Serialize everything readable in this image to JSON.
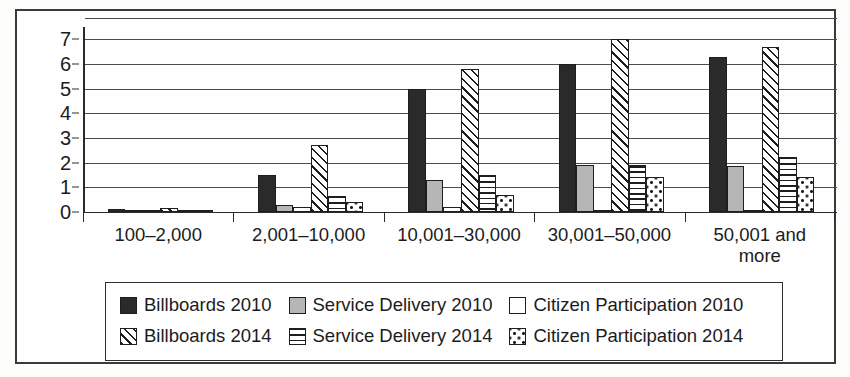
{
  "chart_data": {
    "type": "bar",
    "title": "",
    "subtitle": "",
    "xlabel": "",
    "ylabel": "",
    "ylim": [
      0,
      7.5
    ],
    "yticks": [
      0,
      1,
      2,
      3,
      4,
      5,
      6,
      7
    ],
    "ytick_labels": [
      "0",
      "1",
      "2",
      "3",
      "4",
      "5",
      "6",
      "7"
    ],
    "grid": "horizontal",
    "legend_position": "bottom",
    "categories": [
      "100–2,000",
      "2,001–10,000",
      "10,001–30,000",
      "30,001–50,000",
      "50,001 and\nmore"
    ],
    "series": [
      {
        "name": "Billboards 2010",
        "pattern": "solid-black",
        "values": [
          0.12,
          1.5,
          5.0,
          6.0,
          6.3
        ]
      },
      {
        "name": "Service Delivery 2010",
        "pattern": "solid-gray",
        "values": [
          0.0,
          0.3,
          1.3,
          1.9,
          1.85
        ]
      },
      {
        "name": "Citizen Participation 2010",
        "pattern": "solid-white",
        "values": [
          0.0,
          0.2,
          0.2,
          0.1,
          0.1
        ]
      },
      {
        "name": "Billboards 2014",
        "pattern": "diagonal-hatch",
        "values": [
          0.18,
          2.7,
          5.8,
          7.0,
          6.7
        ]
      },
      {
        "name": "Service Delivery 2014",
        "pattern": "horizontal-lines",
        "values": [
          0.08,
          0.65,
          1.5,
          1.9,
          2.25
        ]
      },
      {
        "name": "Citizen Participation 2014",
        "pattern": "dotted",
        "values": [
          0.05,
          0.4,
          0.7,
          1.4,
          1.4
        ]
      }
    ]
  },
  "legend": {
    "rows": [
      [
        {
          "label": "Billboards 2010",
          "swatch": "solid-black-swatch"
        },
        {
          "label": "Service Delivery 2010",
          "swatch": "solid-gray-swatch"
        },
        {
          "label": "Citizen Participation 2010",
          "swatch": "solid-white-swatch"
        }
      ],
      [
        {
          "label": "Billboards 2014",
          "swatch": "diagonal-hatch-swatch"
        },
        {
          "label": "Service Delivery 2014",
          "swatch": "horizontal-lines-swatch"
        },
        {
          "label": "Citizen Participation 2014",
          "swatch": "dotted-swatch"
        }
      ]
    ]
  },
  "colors": {
    "black_fill": "#2a2a2a",
    "gray_fill": "#b6b6b6",
    "white_fill": "#ffffff",
    "outline": "#1e1e1e",
    "gridline": "#4b4b4b",
    "axis": "#2b2b2b",
    "frame": "#3a3a3a",
    "background": "#fefefe"
  }
}
